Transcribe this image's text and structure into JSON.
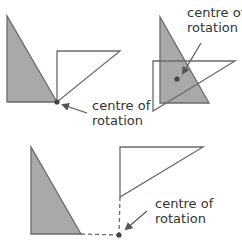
{
  "diagram": {
    "colors": {
      "shaded_fill": "#a9a9a9",
      "stroke": "#6a6a6a",
      "dot": "#444444",
      "text": "#333333",
      "background": "#ffffff"
    },
    "panels": [
      {
        "id": "top-left",
        "description": "Centre of rotation at a vertex of the shape",
        "label_line1": "centre of",
        "label_line2": "rotation"
      },
      {
        "id": "top-right",
        "description": "Centre of rotation inside the shape",
        "label_line1": "centre of",
        "label_line2": "rotation"
      },
      {
        "id": "bottom",
        "description": "Centre of rotation outside the shape with dashed construction lines",
        "label_line1": "centre of",
        "label_line2": "rotation"
      }
    ]
  }
}
